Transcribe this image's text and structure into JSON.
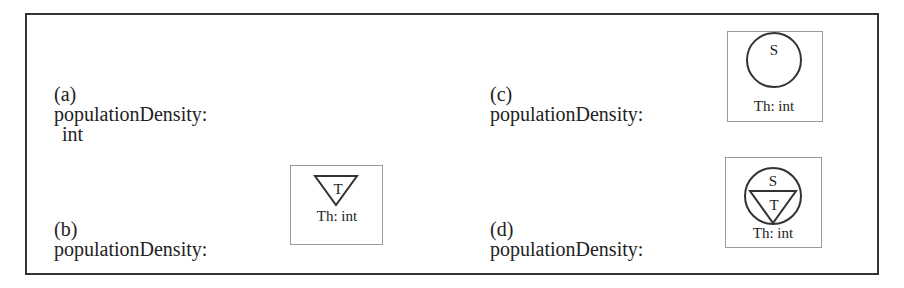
{
  "figure": {
    "panels": [
      {
        "id": "a",
        "tag": "(a)",
        "attribute": "populationDensity:",
        "type": "int",
        "symbol": "none"
      },
      {
        "id": "b",
        "tag": "(b)",
        "attribute": "populationDensity:",
        "symbol": "temporal-triangle",
        "symbol_letters": [
          "T"
        ],
        "symbol_caption": "Th: int"
      },
      {
        "id": "c",
        "tag": "(c)",
        "attribute": "populationDensity:",
        "symbol": "spatial-circle",
        "symbol_letters": [
          "S"
        ],
        "symbol_caption": "Th: int"
      },
      {
        "id": "d",
        "tag": "(d)",
        "attribute": "populationDensity:",
        "symbol": "spatiotemporal-circle-triangle",
        "symbol_letters": [
          "S",
          "T"
        ],
        "symbol_caption": "Th: int"
      }
    ],
    "colors": {
      "frame_border": "#333333",
      "symbol_box_border": "#9a9a9a",
      "stroke": "#333333",
      "text": "#222222"
    }
  }
}
